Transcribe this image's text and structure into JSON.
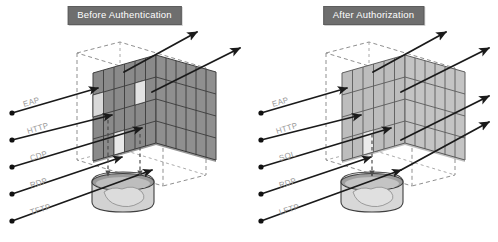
{
  "figure": {
    "type": "diagram",
    "background_color": "#ffffff"
  },
  "panels": [
    {
      "id": "before",
      "title": "Before Authentication",
      "title_bg": "#6e6e6e",
      "title_color": "#ffffff",
      "wall": {
        "name": "policy-grid-wall",
        "fill": "#8a8a8a",
        "stroke": "#4a4a4a",
        "columns": 6,
        "rows": 4,
        "open_cells": 3
      },
      "container": {
        "name": "data-store",
        "fill": "#cfcfcf",
        "stroke": "#4a4a4a"
      },
      "protocols": [
        {
          "label": "EAP",
          "blocked": false
        },
        {
          "label": "HTTP",
          "blocked": false
        },
        {
          "label": "CDP",
          "blocked": true
        },
        {
          "label": "RDP",
          "blocked": false
        },
        {
          "label": "TFTP",
          "blocked": false
        }
      ],
      "passing_arrows": 2,
      "dropped_arrows": 2
    },
    {
      "id": "after",
      "title": "After Authorization",
      "title_bg": "#6e6e6e",
      "title_color": "#ffffff",
      "wall": {
        "name": "policy-grid-wall",
        "fill": "#bdbdbd",
        "stroke": "#6a6a6a",
        "columns": 6,
        "rows": 4,
        "open_cells": 1
      },
      "container": {
        "name": "data-store",
        "fill": "#d6d6d6",
        "stroke": "#4a4a4a"
      },
      "protocols": [
        {
          "label": "EAP",
          "blocked": false
        },
        {
          "label": "HTTP",
          "blocked": false
        },
        {
          "label": "SQL",
          "blocked": false
        },
        {
          "label": "RDP",
          "blocked": true
        },
        {
          "label": "LFTP",
          "blocked": true
        }
      ],
      "passing_arrows": 4,
      "dropped_arrows": 1
    }
  ],
  "colors": {
    "arrow": "#1a1a1a",
    "dashed_box": "#8f8f8f",
    "label_text": "#9a9a9a",
    "title_band": "#6e6e6e"
  }
}
